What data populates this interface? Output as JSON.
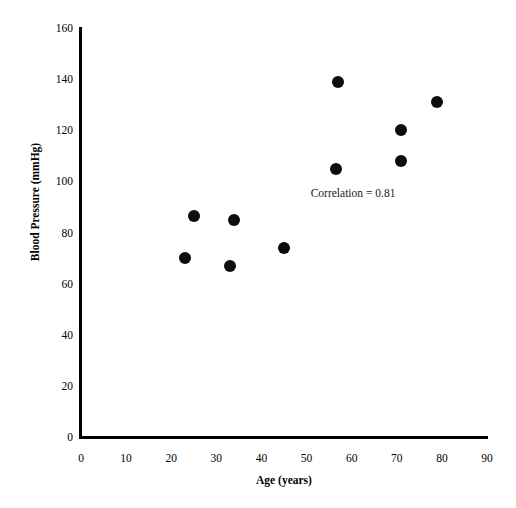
{
  "chart_data": {
    "type": "scatter",
    "title": "",
    "xlabel": "Age (years)",
    "ylabel": "Blood Pressure (mmHg)",
    "xlim": [
      0,
      90
    ],
    "ylim": [
      0,
      160
    ],
    "xticks": [
      0,
      10,
      20,
      30,
      40,
      50,
      60,
      70,
      80,
      90
    ],
    "yticks": [
      0,
      20,
      40,
      60,
      80,
      100,
      120,
      140,
      160
    ],
    "xtick_labels": [
      "0",
      "10",
      "20",
      "30",
      "40",
      "50",
      "60",
      "70",
      "80",
      "90"
    ],
    "ytick_labels": [
      "0",
      "20",
      "40",
      "60",
      "80",
      "100",
      "120",
      "140",
      "160"
    ],
    "grid": false,
    "legend": false,
    "marker": "filled-circle",
    "marker_color": "#0d0d0d",
    "axis_color": "#000000",
    "background": "#ffffff",
    "x": [
      23,
      25,
      33,
      34,
      45,
      56.5,
      57,
      71,
      71,
      79
    ],
    "y": [
      70,
      86.5,
      67,
      85,
      74,
      105,
      139,
      108,
      120,
      131
    ],
    "points": [
      {
        "x": 23,
        "y": 70
      },
      {
        "x": 25,
        "y": 86.5
      },
      {
        "x": 33,
        "y": 67
      },
      {
        "x": 34,
        "y": 85
      },
      {
        "x": 45,
        "y": 74
      },
      {
        "x": 56.5,
        "y": 105
      },
      {
        "x": 57,
        "y": 139
      },
      {
        "x": 71,
        "y": 108
      },
      {
        "x": 71,
        "y": 120
      },
      {
        "x": 79,
        "y": 131
      }
    ],
    "annotations": [
      {
        "text": "Correlation = 0.81",
        "x": 62,
        "y": 95
      }
    ]
  },
  "annotation_text": "Correlation = 0.81"
}
